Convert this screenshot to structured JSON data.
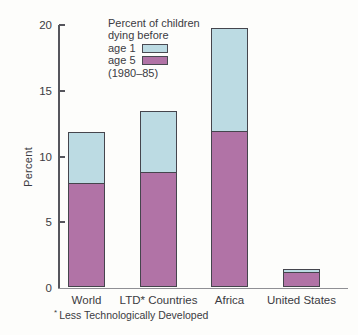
{
  "chart_data": {
    "type": "bar",
    "subtype": "stacked",
    "categories": [
      "World",
      "LTD* Countries",
      "Africa",
      "United States"
    ],
    "series": [
      {
        "name": "age 5 (bottom segment)",
        "color": "#b173a6",
        "values": [
          7.8,
          8.7,
          11.8,
          1.1
        ]
      },
      {
        "name": "age 1 (top segment)",
        "color": "#bcdbe3",
        "values": [
          4.0,
          4.7,
          7.9,
          0.3
        ]
      }
    ],
    "totals": [
      11.8,
      13.4,
      19.7,
      1.4
    ],
    "xlabel": "",
    "ylabel": "Percent",
    "ylim": [
      0,
      20
    ],
    "yticks": [
      0,
      5,
      10,
      15,
      20
    ],
    "grid": false,
    "legend_position": "top-center"
  },
  "legend": {
    "line1": "Percent of children",
    "line2": "dying before",
    "item1_label": "age 1",
    "item2_label": "age 5",
    "period": "(1980–85)"
  },
  "axes": {
    "ylabel": "Percent"
  },
  "footnote": {
    "marker": "*",
    "text": "Less Technologically Developed"
  },
  "colors": {
    "age1_blue": "#bcdbe3",
    "age5_magenta": "#b173a6",
    "bar_outline": "#45454d",
    "text": "#3b3b42",
    "yaxis": "#55555c",
    "baseline": "#8f8f94",
    "background": "#fdfdfb"
  }
}
